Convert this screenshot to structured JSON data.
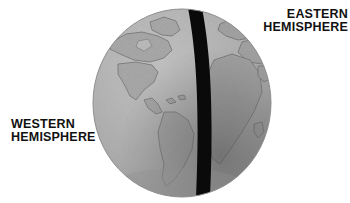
{
  "figure": {
    "kind": "earth-globe-hemispheres-diagram",
    "background_color": "#ffffff",
    "globe": {
      "name": "earth-globe",
      "fill_light": "#b9b9b9",
      "fill_mid": "#9d9d9d",
      "fill_dark": "#6f6f6f",
      "outline_color": "#8a8a8a",
      "divider": {
        "name": "prime-meridian-band",
        "color": "#0a0a0a",
        "description": "thick black vertical band splitting the globe"
      },
      "left_hemisphere_features": "Americas",
      "right_hemisphere_features": "Europe, Africa, western Asia"
    }
  },
  "labels": {
    "eastern": {
      "line1": "EASTERN",
      "line2": "HEMISPHERE",
      "color": "#111111"
    },
    "western": {
      "line1": "WESTERN",
      "line2": "HEMISPHERE",
      "color": "#111111"
    }
  }
}
